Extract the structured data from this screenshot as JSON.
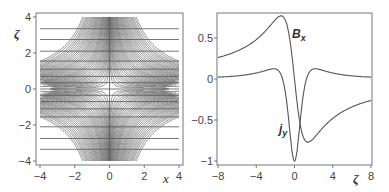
{
  "chart_data": [
    {
      "type": "line",
      "title": "",
      "description": "Field-line (contour) plot of an X-type configuration in the x–zeta plane",
      "xlabel": "x",
      "ylabel": "ζ",
      "xlim": [
        -4,
        4
      ],
      "ylim": [
        -4,
        4
      ],
      "xticks": [
        "−4",
        "−2",
        "0",
        "2",
        "4"
      ],
      "yticks": [
        "−4",
        "−2",
        "0",
        "2",
        "4"
      ],
      "grid": false,
      "legend": null,
      "contour_levels": [
        0.15,
        0.3,
        0.5,
        0.7,
        0.9,
        1.1,
        1.35,
        1.6,
        1.85,
        2.1,
        2.4,
        2.7,
        3.0,
        3.3,
        3.6,
        3.9,
        4.2,
        4.6,
        5.0,
        5.4,
        5.8,
        6.2,
        6.6,
        7.0,
        7.5,
        8.0,
        8.5,
        9.0,
        9.6,
        10.2,
        10.8,
        11.4,
        12.0,
        12.8,
        13.6
      ],
      "horizontal_lines_zeta": [
        -3.35,
        -2.75,
        -2.1,
        -1.55,
        -1.1,
        -0.7,
        -0.35,
        0,
        0.35,
        0.7,
        1.1,
        1.55,
        2.1,
        2.75,
        3.35
      ],
      "vertical_line_x": 0
    },
    {
      "type": "line",
      "title": "",
      "xlabel": "ζ",
      "ylabel": "",
      "xlim": [
        -8,
        8
      ],
      "ylim": [
        -1.05,
        0.8
      ],
      "xticks": [
        "−8",
        "−4",
        "0",
        "4",
        "8"
      ],
      "yticks": [
        "−1",
        "−0.5",
        "0",
        "0.5"
      ],
      "grid": false,
      "legend": null,
      "x": [
        -8,
        -7,
        -6,
        -5,
        -4,
        -3,
        -2.5,
        -2,
        -1.5,
        -1.2,
        -1,
        -0.5,
        0,
        0.5,
        1,
        1.2,
        1.5,
        2,
        2.5,
        3,
        4,
        5,
        6,
        7,
        8
      ],
      "series": [
        {
          "name": "B_x",
          "values": [
            0.12,
            0.15,
            0.19,
            0.24,
            0.32,
            0.45,
            0.55,
            0.67,
            0.77,
            0.76,
            0.72,
            0.42,
            0,
            -0.42,
            -0.72,
            -0.76,
            -0.77,
            -0.67,
            -0.55,
            -0.45,
            -0.32,
            -0.24,
            -0.19,
            -0.15,
            -0.12
          ]
        },
        {
          "name": "j_y",
          "values": [
            0.01,
            0.02,
            0.03,
            0.05,
            0.09,
            0.2,
            0.28,
            0.29,
            0.12,
            -0.1,
            -0.3,
            -0.75,
            -1.0,
            -0.75,
            -0.3,
            -0.1,
            0.12,
            0.29,
            0.28,
            0.2,
            0.09,
            0.05,
            0.03,
            0.02,
            0.01
          ]
        }
      ],
      "annotations": [
        {
          "text": "B",
          "sub": "x",
          "x": 0.1,
          "y": 0.6
        },
        {
          "text": "j",
          "sub": "y",
          "x": -1.1,
          "y": -0.62
        }
      ]
    }
  ],
  "left_plot": {
    "xlabel": "x",
    "ylabel": "ζ",
    "xticks": [
      {
        "v": -4,
        "label": "−4"
      },
      {
        "v": -2,
        "label": "−2"
      },
      {
        "v": 0,
        "label": "0"
      },
      {
        "v": 2,
        "label": "2"
      },
      {
        "v": 4,
        "label": "4"
      }
    ],
    "yticks": [
      {
        "v": -4,
        "label": "−4"
      },
      {
        "v": -2,
        "label": "−2"
      },
      {
        "v": 0,
        "label": "0"
      },
      {
        "v": 2,
        "label": "2"
      },
      {
        "v": 4,
        "label": "4"
      }
    ]
  },
  "right_plot": {
    "xlabel": "ζ",
    "label_bx": "B",
    "label_bx_sub": "x",
    "label_jy": "j",
    "label_jy_sub": "y",
    "xticks": [
      {
        "v": -8,
        "label": "−8"
      },
      {
        "v": -4,
        "label": "−4"
      },
      {
        "v": 0,
        "label": "0"
      },
      {
        "v": 4,
        "label": "4"
      },
      {
        "v": 8,
        "label": "8"
      }
    ],
    "yticks": [
      {
        "v": 0.5,
        "label": "0.5"
      },
      {
        "v": 0,
        "label": "0"
      },
      {
        "v": -0.5,
        "label": "−0.5"
      },
      {
        "v": -1,
        "label": "−1"
      }
    ]
  },
  "colors": {
    "line": "#555555",
    "frame": "#666666",
    "text": "#333333"
  }
}
